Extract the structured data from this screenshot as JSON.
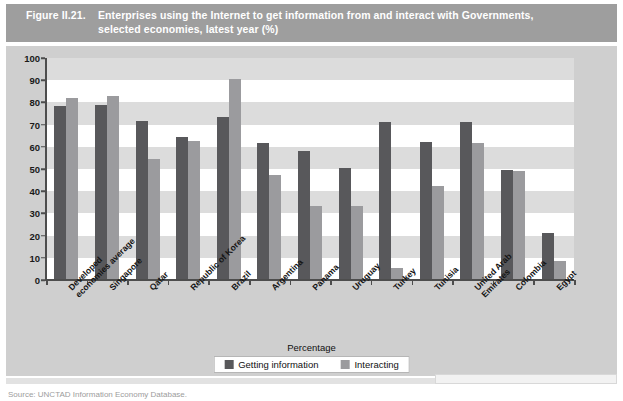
{
  "figure": {
    "number": "Figure II.21.",
    "title_line1": "Enterprises using the Internet to get information from and interact with Governments,",
    "title_line2": "selected economies, latest year (%)"
  },
  "legend": {
    "items": [
      {
        "label": "Getting information",
        "color": "#58585b"
      },
      {
        "label": "Interacting",
        "color": "#9b9b9e"
      }
    ]
  },
  "axis": {
    "x_title": "Percentage",
    "y_ticks": [
      "0",
      "10",
      "20",
      "30",
      "40",
      "50",
      "60",
      "70",
      "80",
      "90",
      "100"
    ]
  },
  "source": {
    "text": "Source:   UNCTAD Information Economy Database."
  },
  "chart_data": {
    "type": "bar",
    "title": "Enterprises using the Internet to get information from and interact with Governments, selected economies, latest year (%)",
    "xlabel": "Percentage",
    "ylabel": "",
    "ylim": [
      0,
      100
    ],
    "ytick_step": 10,
    "grid": "horizontal-bands",
    "legend_position": "bottom-center",
    "categories": [
      "Developed economies average",
      "Singapore",
      "Qatar",
      "Republic of Korea",
      "Brazil",
      "Argentina",
      "Panama",
      "Uruguay",
      "Turkey",
      "Tunisia",
      "United Arab Emirates",
      "Colombia",
      "Egypt"
    ],
    "series": [
      {
        "name": "Getting information",
        "color": "#58585b",
        "values": [
          78.5,
          79.0,
          71.5,
          64.5,
          73.5,
          61.5,
          58.0,
          50.5,
          71.0,
          62.0,
          71.0,
          49.5,
          21.0
        ]
      },
      {
        "name": "Interacting",
        "color": "#9b9b9e",
        "values": [
          82.0,
          83.0,
          54.5,
          62.5,
          90.5,
          47.5,
          33.5,
          33.5,
          5.5,
          42.5,
          61.5,
          49.0,
          8.5
        ]
      }
    ]
  }
}
